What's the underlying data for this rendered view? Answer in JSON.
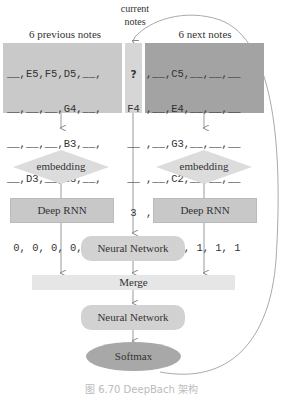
{
  "headers": {
    "previous": "6 previous notes",
    "current_line1": "current",
    "current_line2": "notes",
    "next": "6 next notes"
  },
  "grid": {
    "previous_rows": [
      "__,E5,F5,D5,__,",
      "__,__,__,G4,__,",
      "__,__,__,B3,__,",
      "__,D3,__,G3,__,",
      " 2, 3, 4, 1, 2,",
      " 0, 0, 0, 0, 0,"
    ],
    "current_rows": [
      "?",
      "F4",
      "__",
      "__",
      "3",
      "0"
    ],
    "next_rows": [
      ",__,C5,__,__,__",
      ",__,E4,__,__,__",
      ",__,G3,__,__,__",
      ",__,C2,__,__,__",
      ", 4, 1, 2, 3, 4",
      ", 0, 1, 1, 1, 1"
    ]
  },
  "nodes": {
    "embedding_left": "embedding",
    "embedding_right": "embedding",
    "rnn_left": "Deep RNN",
    "rnn_right": "Deep RNN",
    "nn_top": "Neural Network",
    "merge": "Merge",
    "nn_bottom": "Neural Network",
    "softmax": "Softmax"
  },
  "caption": "图 6.70  DeepBach 架构",
  "colors": {
    "previous_panel": "#c9c9c9",
    "current_panel": "#d6d6d6",
    "next_panel": "#a3a3a3",
    "softmax": "#a8a8a8"
  }
}
